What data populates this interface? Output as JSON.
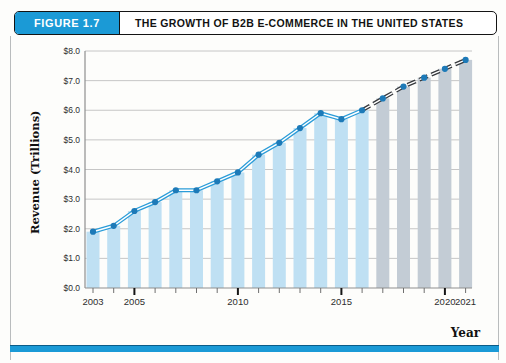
{
  "figure": {
    "label": "FIGURE 1.7",
    "title": "THE GROWTH OF B2B E-COMMERCE IN THE UNITED STATES"
  },
  "chart_data": {
    "type": "bar",
    "title": "The Growth of B2B E-Commerce in the United States",
    "xlabel": "Year",
    "ylabel": "Revenue (Trillions)",
    "x": [
      2003,
      2004,
      2005,
      2006,
      2007,
      2008,
      2009,
      2010,
      2011,
      2012,
      2013,
      2014,
      2015,
      2016,
      2017,
      2018,
      2019,
      2020,
      2021
    ],
    "values": [
      1.9,
      2.1,
      2.6,
      2.9,
      3.3,
      3.3,
      3.6,
      3.9,
      4.5,
      4.9,
      5.4,
      5.9,
      5.7,
      6.0,
      6.4,
      6.8,
      7.1,
      7.4,
      7.7
    ],
    "overlay_line": true,
    "actual_through_year": 2016,
    "projected_years": [
      2017,
      2018,
      2019,
      2020,
      2021
    ],
    "ylim": [
      0,
      8
    ],
    "ytick_labels": [
      "$0.0",
      "$1.0",
      "$2.0",
      "$3.0",
      "$4.0",
      "$5.0",
      "$6.0",
      "$7.0",
      "$8.0"
    ],
    "xtick_labels": [
      "2003",
      "2005",
      "2010",
      "2015",
      "2020",
      "2021"
    ],
    "major_tick_years": [
      2005,
      2010,
      2015,
      2020
    ],
    "grid": true,
    "legend": "none"
  },
  "colors": {
    "banner_blue": "#1b9ad6",
    "bar_actual": "#bfe0f3",
    "bar_projected": "#c3ccd5",
    "line_actual": "#2b9cd8",
    "line_projected": "#36393d",
    "line_core": "#ffffff",
    "marker": "#1d7ab8",
    "gridline": "#c6c6c6",
    "axis": "#8f8f8f",
    "tick_label": "#2e2e2e",
    "bottom_rule": "#1b9ad6"
  }
}
